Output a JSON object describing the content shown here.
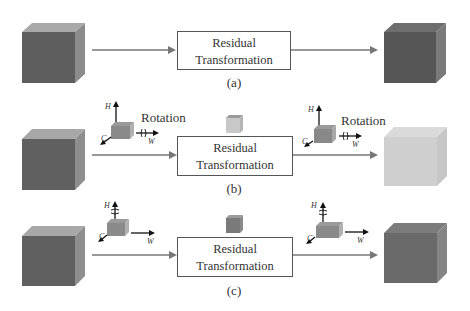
{
  "diagram": {
    "rows": [
      {
        "id": "a",
        "caption": "(a)",
        "box": {
          "line1": "Residual",
          "line2": "Transformation"
        },
        "input_cube": {
          "front": "#5e5e5e",
          "top": "#a9a9a9",
          "side": "#8c8c8c"
        },
        "output_cube": {
          "front": "#565656",
          "top": "#6e6e6e",
          "side": "#7a7a7a"
        }
      },
      {
        "id": "b",
        "caption": "(b)",
        "box": {
          "line1": "Residual",
          "line2": "Transformation"
        },
        "input_cube": {
          "front": "#606060",
          "top": "#a8a8a8",
          "side": "#8e8e8e"
        },
        "output_cube": {
          "front": "#cfcfcf",
          "top": "#dadada",
          "side": "#c6c6c6"
        },
        "mini_cube": {
          "front": "#c8c8c8",
          "top": "#9a9a9a",
          "side": "#b5b5b5"
        },
        "left_axes": {
          "h": "H",
          "w": "W",
          "c": "C",
          "label": "Rotation",
          "rotation_axis": "W"
        },
        "right_axes": {
          "h": "H",
          "w": "W",
          "c": "C",
          "label": "Rotation",
          "rotation_axis": "W"
        }
      },
      {
        "id": "c",
        "caption": "(c)",
        "box": {
          "line1": "Residual",
          "line2": "Transformation"
        },
        "input_cube": {
          "front": "#606060",
          "top": "#a8a8a8",
          "side": "#8e8e8e"
        },
        "output_cube": {
          "front": "#6a6a6a",
          "top": "#7c7c7c",
          "side": "#858585"
        },
        "mini_cube": {
          "front": "#7a7a7a",
          "top": "#9a9a9a",
          "side": "#8a8a8a"
        },
        "left_axes": {
          "h": "H",
          "w": "W",
          "c": "C",
          "rotation_axis": "H"
        },
        "right_axes": {
          "h": "H",
          "w": "W",
          "c": "C",
          "rotation_axis": "H"
        }
      }
    ],
    "colors": {
      "arrow": "#777777",
      "box_border": "#555555",
      "axis": "#111111"
    }
  }
}
